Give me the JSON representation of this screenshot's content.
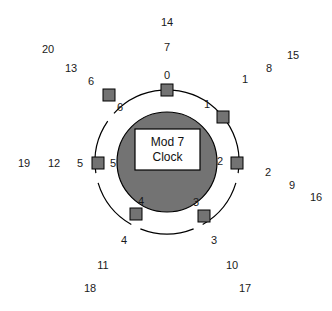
{
  "figure": {
    "center_label_line1": "Mod 7",
    "center_label_line2": "Clock",
    "modulus": 7,
    "colors": {
      "marker_fill": "#737373",
      "marker_stroke": "#000000",
      "hub_fill": "#737373",
      "hub_stroke": "#000000",
      "ring_stroke": "#000000",
      "center_box_fill": "#ffffff",
      "center_box_stroke": "#000000",
      "text": "#1a1a1a",
      "background": "#ffffff"
    },
    "geometry": {
      "center_x": 167,
      "center_y": 162,
      "ring_radius": 72,
      "hub_radius": 50,
      "marker_size": 12,
      "box_x": 135,
      "box_y": 129,
      "box_w": 65,
      "box_h": 41
    }
  },
  "chart_data": {
    "type": "diagram",
    "title": "Mod 7 Clock",
    "positions": [
      {
        "residue": "0",
        "angle_deg": 0,
        "marker_x": 167,
        "marker_y": 90,
        "inner_label": "0",
        "inner_label_x": 167,
        "inner_label_y": 75,
        "outer_labels": [
          {
            "text": "7",
            "x": 167,
            "y": 47
          },
          {
            "text": "14",
            "x": 167,
            "y": 22
          }
        ]
      },
      {
        "residue": "1",
        "angle_deg": 51.43,
        "marker_x": 223,
        "marker_y": 117,
        "inner_label": "1",
        "inner_label_x": 207,
        "inner_label_y": 104,
        "outer_labels": [
          {
            "text": "1",
            "x": 245,
            "y": 79
          },
          {
            "text": "8",
            "x": 269,
            "y": 68
          },
          {
            "text": "15",
            "x": 293,
            "y": 55
          }
        ]
      },
      {
        "residue": "2",
        "angle_deg": 102.86,
        "marker_x": 237,
        "marker_y": 163,
        "inner_label": "2",
        "inner_label_x": 220,
        "inner_label_y": 161,
        "outer_labels": [
          {
            "text": "2",
            "x": 268,
            "y": 172
          },
          {
            "text": "9",
            "x": 292,
            "y": 185
          },
          {
            "text": "16",
            "x": 316,
            "y": 197
          }
        ]
      },
      {
        "residue": "3",
        "angle_deg": 154.29,
        "marker_x": 204,
        "marker_y": 216,
        "inner_label": "3",
        "inner_label_x": 196,
        "inner_label_y": 202,
        "outer_labels": [
          {
            "text": "3",
            "x": 214,
            "y": 240
          },
          {
            "text": "10",
            "x": 232,
            "y": 265
          },
          {
            "text": "17",
            "x": 245,
            "y": 288
          }
        ]
      },
      {
        "residue": "4",
        "angle_deg": 205.71,
        "marker_x": 136,
        "marker_y": 214,
        "inner_label": "4",
        "inner_label_x": 141,
        "inner_label_y": 201,
        "outer_labels": [
          {
            "text": "4",
            "x": 124,
            "y": 240
          },
          {
            "text": "11",
            "x": 103,
            "y": 265
          },
          {
            "text": "18",
            "x": 90,
            "y": 288
          }
        ]
      },
      {
        "residue": "5",
        "angle_deg": 257.14,
        "marker_x": 98,
        "marker_y": 163,
        "inner_label": "5",
        "inner_label_x": 113,
        "inner_label_y": 163,
        "outer_labels": [
          {
            "text": "5",
            "x": 80,
            "y": 163
          },
          {
            "text": "12",
            "x": 54,
            "y": 163
          },
          {
            "text": "19",
            "x": 24,
            "y": 163
          }
        ]
      },
      {
        "residue": "6",
        "angle_deg": 308.57,
        "marker_x": 109,
        "marker_y": 95,
        "inner_label": "6",
        "inner_label_x": 120,
        "inner_label_y": 107,
        "outer_labels": [
          {
            "text": "6",
            "x": 91,
            "y": 81
          },
          {
            "text": "13",
            "x": 71,
            "y": 68
          },
          {
            "text": "20",
            "x": 48,
            "y": 49
          }
        ]
      }
    ]
  }
}
